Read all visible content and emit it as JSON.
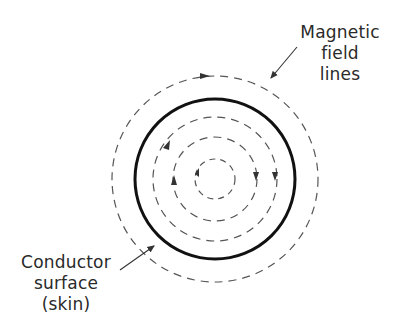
{
  "diagram": {
    "labels": {
      "field": [
        "Magnetic",
        "field",
        "lines"
      ],
      "conductor": [
        "Conductor",
        "surface",
        "(skin)"
      ]
    },
    "geometry": {
      "center": [
        215,
        179
      ],
      "outer_field_radius": 103,
      "conductor_radius": 80,
      "inner_field_radii": [
        62,
        42,
        20
      ]
    },
    "colors": {
      "stroke": "#444444",
      "conductor": "#111111",
      "text": "#2a2a2a"
    }
  }
}
